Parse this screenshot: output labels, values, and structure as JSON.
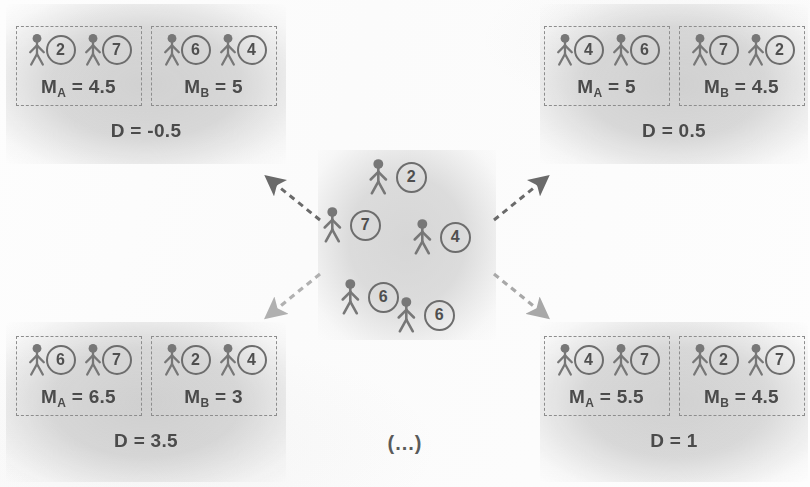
{
  "figure": {
    "ellipsis_note": "(...)",
    "icon_person": "person-icon",
    "colors": {
      "ink": "#4b4b4b",
      "dashed_border": "#8d8d8d",
      "panel_halo": "#c8c8c8",
      "arrow_dark": "#5d5d5d",
      "arrow_light": "#b9b9b9",
      "paper": "#fdfdfd"
    }
  },
  "pool": {
    "name": "candidate-pool",
    "members": [
      {
        "value": "2",
        "x": 48,
        "y": 8
      },
      {
        "value": "7",
        "x": 2,
        "y": 56
      },
      {
        "value": "4",
        "x": 92,
        "y": 68
      },
      {
        "value": "6",
        "x": 20,
        "y": 128
      },
      {
        "value": "6",
        "x": 76,
        "y": 146
      }
    ]
  },
  "panels": [
    {
      "id": "top-left",
      "groups": [
        {
          "label": "A",
          "members": [
            "2",
            "7"
          ],
          "mean_text": "M",
          "mean_sub": "A",
          "mean_value": "= 4.5"
        },
        {
          "label": "B",
          "members": [
            "6",
            "4"
          ],
          "mean_text": "M",
          "mean_sub": "B",
          "mean_value": "= 5"
        }
      ],
      "d_label": "D = -0.5"
    },
    {
      "id": "top-right",
      "groups": [
        {
          "label": "A",
          "members": [
            "4",
            "6"
          ],
          "mean_text": "M",
          "mean_sub": "A",
          "mean_value": "= 5"
        },
        {
          "label": "B",
          "members": [
            "7",
            "2"
          ],
          "mean_text": "M",
          "mean_sub": "B",
          "mean_value": "= 4.5"
        }
      ],
      "d_label": "D = 0.5"
    },
    {
      "id": "bottom-left",
      "groups": [
        {
          "label": "A",
          "members": [
            "6",
            "7"
          ],
          "mean_text": "M",
          "mean_sub": "A",
          "mean_value": "= 6.5"
        },
        {
          "label": "B",
          "members": [
            "2",
            "4"
          ],
          "mean_text": "M",
          "mean_sub": "B",
          "mean_value": "= 3"
        }
      ],
      "d_label": "D = 3.5"
    },
    {
      "id": "bottom-right",
      "groups": [
        {
          "label": "A",
          "members": [
            "4",
            "7"
          ],
          "mean_text": "M",
          "mean_sub": "A",
          "mean_value": "= 5.5"
        },
        {
          "label": "B",
          "members": [
            "2",
            "7"
          ],
          "mean_text": "M",
          "mean_sub": "B",
          "mean_value": "= 4.5"
        }
      ],
      "d_label": "D = 1"
    }
  ],
  "arrows": [
    {
      "name": "arrow-to-top-left",
      "direction": "up-left"
    },
    {
      "name": "arrow-to-top-right",
      "direction": "up-right"
    },
    {
      "name": "arrow-to-bottom-left",
      "direction": "down-left"
    },
    {
      "name": "arrow-to-bottom-right",
      "direction": "down-right"
    }
  ]
}
